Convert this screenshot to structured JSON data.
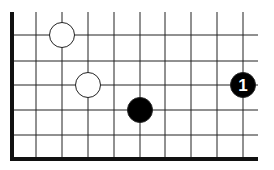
{
  "board": {
    "columns_x": [
      36,
      62,
      88,
      114,
      140,
      165,
      191,
      217,
      243
    ],
    "rows_y": [
      35,
      61,
      85,
      110,
      135
    ],
    "left_edge_x": 12,
    "bottom_edge_y": 159,
    "top_y": 12,
    "right_x": 258,
    "line_color": "#222222",
    "edge_color": "#111111"
  },
  "stones": [
    {
      "color": "white",
      "x": 62,
      "y": 35,
      "label": ""
    },
    {
      "color": "white",
      "x": 88,
      "y": 85,
      "label": ""
    },
    {
      "color": "black",
      "x": 140,
      "y": 110,
      "label": ""
    },
    {
      "color": "black",
      "x": 243,
      "y": 85,
      "label": "1"
    }
  ],
  "move_label": "1"
}
